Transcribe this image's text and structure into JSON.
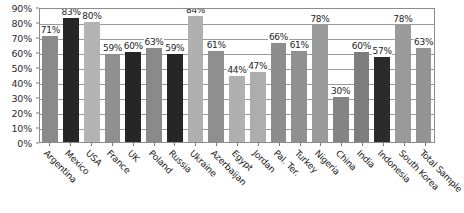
{
  "chart_data": {
    "type": "bar",
    "title": "",
    "subtitle": "",
    "xlabel": "",
    "ylabel": "",
    "ylim": [
      0,
      90
    ],
    "ytick_step": 10,
    "ytick_labels": [
      "0%",
      "10%",
      "20%",
      "30%",
      "40%",
      "50%",
      "60%",
      "70%",
      "80%",
      "90%"
    ],
    "ytick_values": [
      0,
      10,
      20,
      30,
      40,
      50,
      60,
      70,
      80,
      90
    ],
    "grid": "horizontal",
    "legend": "none",
    "value_label_suffix": "%",
    "categories": [
      "Argentina",
      "Mexico",
      "USA",
      "France",
      "UK",
      "Poland",
      "Russia",
      "Ukraine",
      "Azerbaijan",
      "Egypt",
      "Jordan",
      "Pal. Ter.",
      "Turkey",
      "Nigeria",
      "China",
      "India",
      "Indonesia",
      "South Korea",
      "Total Sample"
    ],
    "values": [
      71,
      83,
      80,
      59,
      60,
      63,
      59,
      84,
      61,
      44,
      47,
      66,
      61,
      78,
      30,
      60,
      57,
      78,
      63
    ],
    "value_labels": [
      "71%",
      "83%",
      "80%",
      "59%",
      "60%",
      "63%",
      "59%",
      "84%",
      "61%",
      "44%",
      "47%",
      "66%",
      "61%",
      "78%",
      "30%",
      "60%",
      "57%",
      "78%",
      "63%"
    ],
    "bar_colors": [
      "#8a8a8a",
      "#262626",
      "#b3b3b3",
      "#8f8f8f",
      "#262626",
      "#8a8a8a",
      "#262626",
      "#b0b0b0",
      "#8f8f8f",
      "#b0b0b0",
      "#adadad",
      "#8d8d8d",
      "#909090",
      "#9a9a9a",
      "#848484",
      "#7e7e7e",
      "#2b2b2b",
      "#9a9a9a",
      "#949494"
    ]
  },
  "colors": {
    "plot_background": "#ffffff",
    "gridline": "#9a9a9a",
    "axis_line": "#8c8c8c",
    "text": "#232323"
  }
}
